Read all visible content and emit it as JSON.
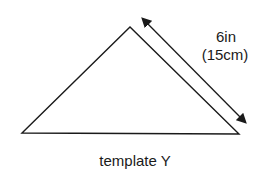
{
  "diagram": {
    "title": "template Y",
    "shape": "triangle",
    "vertices": {
      "left": [
        22,
        133
      ],
      "apex": [
        130,
        27
      ],
      "right": [
        239,
        134
      ]
    },
    "dimension": {
      "imperial": "6in",
      "metric": "(15cm)",
      "arrow_start": [
        141,
        17
      ],
      "arrow_end": [
        247,
        124
      ]
    },
    "colors": {
      "stroke": "#1a1a1a",
      "background": "#ffffff"
    }
  }
}
